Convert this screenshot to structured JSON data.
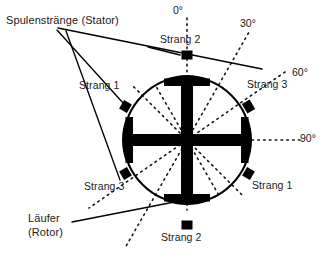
{
  "diagram": {
    "title_hidden": "Dreiphasen-Motor Querschnitt",
    "colors": {
      "ink": "#000000",
      "background": "#ffffff",
      "dotted": "#222222"
    },
    "labels": {
      "stator_group": "Spulenstränge (Stator)",
      "rotor_line1": "Läufer",
      "rotor_line2": "(Rotor)",
      "strang1_upper_left": "Strang 1",
      "strang1_lower_right": "Strang 1",
      "strang2_top": "Strang 2",
      "strang2_bottom": "Strang 2",
      "strang3_upper_right": "Strang 3",
      "strang3_lower_left": "Strang 3"
    },
    "angles": {
      "a0": "0°",
      "a30": "30°",
      "a60": "60°",
      "a90": "90°"
    },
    "geometry": {
      "center_x": 187,
      "center_y": 140,
      "radius": 63,
      "radial_step_deg": 30
    },
    "coils": [
      {
        "name": "strang2-top",
        "angle_deg": 0,
        "phase": "Strang 2"
      },
      {
        "name": "strang3-upper-right",
        "angle_deg": 60,
        "phase": "Strang 3"
      },
      {
        "name": "strang1-lower-right",
        "angle_deg": 120,
        "phase": "Strang 1"
      },
      {
        "name": "strang2-bottom",
        "angle_deg": 180,
        "phase": "Strang 2"
      },
      {
        "name": "strang3-lower-left",
        "angle_deg": 240,
        "phase": "Strang 3"
      },
      {
        "name": "strang1-upper-left",
        "angle_deg": 300,
        "phase": "Strang 1"
      }
    ]
  }
}
